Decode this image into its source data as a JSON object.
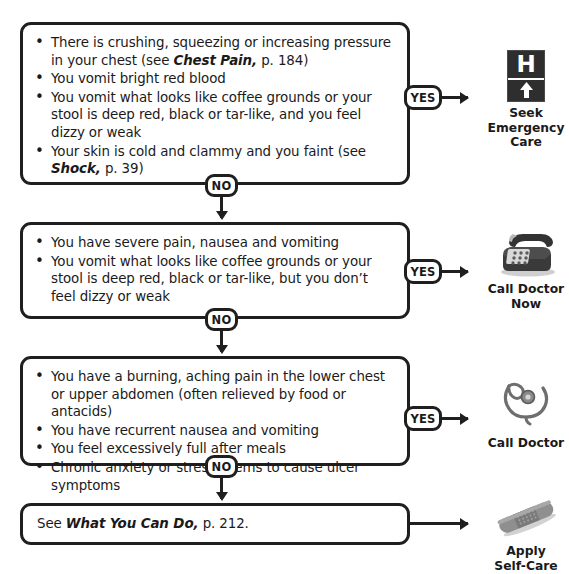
{
  "page": {
    "background_color": "#ffffff",
    "line_color": "#1f1f1f"
  },
  "labels": {
    "yes": "YES",
    "no": "NO"
  },
  "steps": [
    {
      "id": "step-1",
      "symptoms": [
        {
          "segments": [
            {
              "text": "There is crushing, squeezing or increasing pressure in your chest (see ",
              "style": "normal"
            },
            {
              "text": "Chest Pain,",
              "style": "bold-italic"
            },
            {
              "text": " p. 184)",
              "style": "normal"
            }
          ]
        },
        {
          "segments": [
            {
              "text": "You vomit bright red blood",
              "style": "normal"
            }
          ]
        },
        {
          "segments": [
            {
              "text": "You vomit what looks like coffee grounds or your stool is deep red, black or tar-like, and you feel dizzy or weak",
              "style": "normal"
            }
          ]
        },
        {
          "segments": [
            {
              "text": "Your skin is cold and clammy and you faint (see ",
              "style": "normal"
            },
            {
              "text": "Shock,",
              "style": "bold-italic"
            },
            {
              "text": " p. 39)",
              "style": "normal"
            }
          ]
        }
      ],
      "outcome": {
        "icon": "hospital-sign-icon",
        "label": "Seek\nEmergency\nCare"
      }
    },
    {
      "id": "step-2",
      "symptoms": [
        {
          "segments": [
            {
              "text": "You have severe pain, nausea and vomiting",
              "style": "normal"
            }
          ]
        },
        {
          "segments": [
            {
              "text": "You vomit what looks like coffee grounds or your stool is deep red, black or tar-like, but you don’t feel dizzy or weak",
              "style": "normal"
            }
          ]
        }
      ],
      "outcome": {
        "icon": "telephone-icon",
        "label": "Call Doctor\nNow"
      }
    },
    {
      "id": "step-3",
      "symptoms": [
        {
          "segments": [
            {
              "text": "You have a burning, aching pain in the lower chest or upper abdomen (often relieved by food or antacids)",
              "style": "normal"
            }
          ]
        },
        {
          "segments": [
            {
              "text": "You have recurrent nausea and vomiting",
              "style": "normal"
            }
          ]
        },
        {
          "segments": [
            {
              "text": "You feel excessively full after meals",
              "style": "normal"
            }
          ]
        },
        {
          "segments": [
            {
              "text": "Chronic anxiety or stress seems to cause ulcer symptoms",
              "style": "normal"
            }
          ]
        }
      ],
      "outcome": {
        "icon": "stethoscope-icon",
        "label": "Call Doctor"
      }
    },
    {
      "id": "step-4",
      "plain_text": {
        "segments": [
          {
            "text": "See ",
            "style": "normal"
          },
          {
            "text": "What You Can Do,",
            "style": "bold-italic"
          },
          {
            "text": " p. 212.",
            "style": "normal"
          }
        ]
      },
      "outcome": {
        "icon": "bandage-icon",
        "label": "Apply\nSelf-Care"
      }
    }
  ]
}
